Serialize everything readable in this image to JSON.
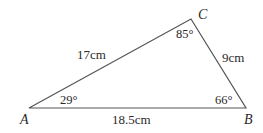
{
  "diagram": {
    "type": "triangle",
    "stroke_color": "#555555",
    "text_color": "#2a2a2a",
    "vertices": [
      {
        "name": "A",
        "x": 29,
        "y": 108
      },
      {
        "name": "B",
        "x": 246,
        "y": 108
      },
      {
        "name": "C",
        "x": 191,
        "y": 19
      }
    ],
    "sides": {
      "AC": "17cm",
      "CB": "9cm",
      "AB": "18.5cm"
    },
    "angles": {
      "A": "29°",
      "B": "66°",
      "C": "85°"
    }
  }
}
